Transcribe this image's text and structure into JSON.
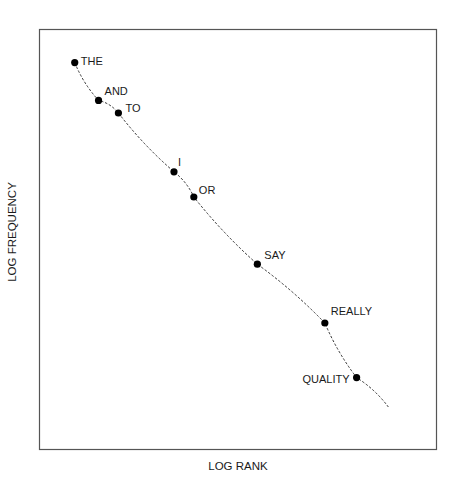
{
  "chart_data": {
    "type": "line",
    "title": "",
    "xlabel": "LOG RANK",
    "ylabel": "LOG FREQUENCY",
    "grid": false,
    "legend": null,
    "line_style": "dashed",
    "points": [
      {
        "label": "THE",
        "x": 0.09,
        "y": 0.92
      },
      {
        "label": "AND",
        "x": 0.15,
        "y": 0.83
      },
      {
        "label": "TO",
        "x": 0.2,
        "y": 0.8
      },
      {
        "label": "I",
        "x": 0.34,
        "y": 0.66
      },
      {
        "label": "OR",
        "x": 0.39,
        "y": 0.6
      },
      {
        "label": "SAY",
        "x": 0.55,
        "y": 0.44
      },
      {
        "label": "REALLY",
        "x": 0.72,
        "y": 0.3
      },
      {
        "label": "QUALITY",
        "x": 0.8,
        "y": 0.17
      }
    ],
    "line_end": {
      "x": 0.88,
      "y": 0.1
    }
  },
  "plot": {
    "frame": {
      "left": 39,
      "top": 29,
      "right": 436,
      "bottom": 449
    },
    "marker_color": "#000000",
    "line_color": "#333333"
  }
}
